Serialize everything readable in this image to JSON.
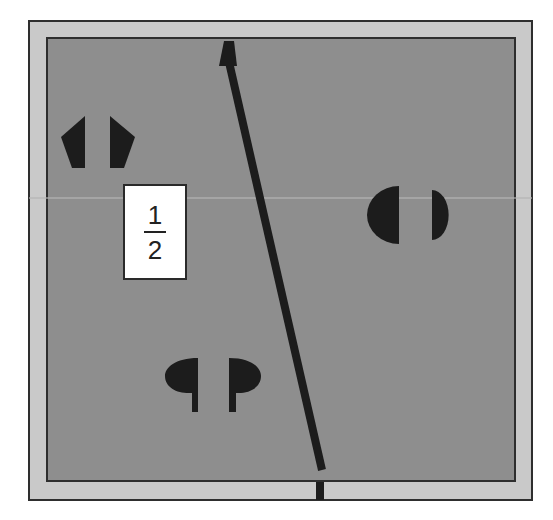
{
  "diagram": {
    "colors": {
      "background": "#ffffff",
      "outer_frame": "#c9c9c9",
      "inner_field": "#8e8e8e",
      "border_line": "#2e2e2e",
      "shape_fill": "#1c1c1c",
      "scan_band": "#b4b4b4"
    },
    "outer_frame": {
      "x": 29,
      "y": 21,
      "w": 503,
      "h": 479
    },
    "inner_field": {
      "x": 47,
      "y": 38,
      "w": 468,
      "h": 443
    },
    "fraction_label": {
      "numerator": "1",
      "denominator": "2",
      "x": 123,
      "y": 184,
      "w": 64,
      "h": 96
    },
    "line": {
      "arrow_points": "224,41 234,41 237,66 219,66",
      "start": [
        229,
        62
      ],
      "end": [
        322,
        470
      ],
      "width": 8
    },
    "tick": {
      "x": 316,
      "y": 482,
      "w": 8,
      "h": 18
    },
    "shapes": {
      "pentagon_left": "85,116 61,137 72,168 85,168",
      "pentagon_right": "110,116 135,137 124,168 110,168",
      "circle_left_path": "M 399 186 A 32 29 0 0 0 399 244 Z",
      "circle_right_path": "M 432 190 A 16 24 0 0 1 432 240 Z",
      "drop_left_path": "M 198 358 C 175 358 165 368 165 376 C 165 388 178 394 192 393 L 192 412 L 198 412 Z",
      "drop_right_path": "M 229 358 C 252 358 261 368 261 376 C 261 388 248 394 236 393 L 236 412 L 229 412 Z"
    }
  }
}
